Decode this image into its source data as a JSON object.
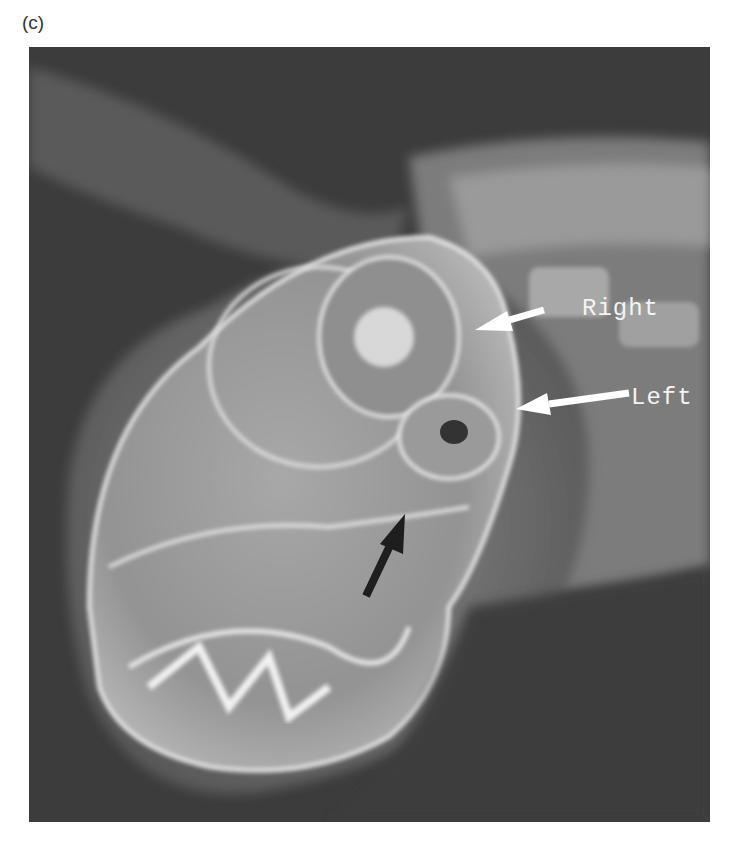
{
  "figure": {
    "panel_label": "(c)",
    "image_type": "radiograph-lateral-skull",
    "annotations": [
      {
        "text": "Right",
        "arrow_color": "#ffffff"
      },
      {
        "text": "Left",
        "arrow_color": "#ffffff"
      }
    ],
    "unlabeled_arrow": {
      "color": "#1a1a1a",
      "direction": "up-right"
    },
    "colors": {
      "background": "#3a3a3a",
      "bone": "#d9d9d9",
      "soft_tissue": "#7a7a7a"
    }
  }
}
